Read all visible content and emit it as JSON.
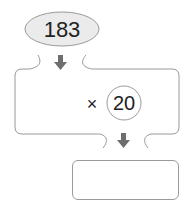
{
  "diagram": {
    "start_value": "183",
    "operator": "×",
    "multiplier": "20",
    "answer_value": ""
  },
  "colors": {
    "ellipse_fill": "#ebebeb",
    "stroke": "#9a9a9a",
    "arrow": "#6e6e6e",
    "text": "#222222"
  }
}
